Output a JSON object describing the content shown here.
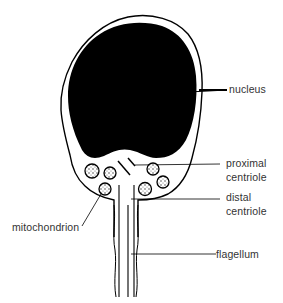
{
  "diagram": {
    "type": "labeled biological illustration",
    "colors": {
      "background": "#ffffff",
      "ink": "#000000",
      "label_text": "#333333",
      "nucleus_fill": "#000000"
    },
    "labels": {
      "nucleus": "nucleus",
      "proximal_centriole_line1": "proximal",
      "proximal_centriole_line2": "centriole",
      "distal_centriole_line1": "distal",
      "distal_centriole_line2": "centriole",
      "mitochondrion": "mitochondrion",
      "flagellum": "flagellum"
    }
  }
}
